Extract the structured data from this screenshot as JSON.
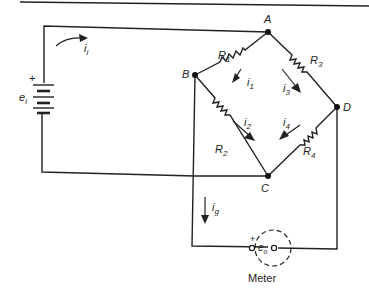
{
  "diagram": {
    "type": "wheatstone-bridge-circuit",
    "nodes": {
      "A": "A",
      "B": "B",
      "C": "C",
      "D": "D"
    },
    "resistors": {
      "r1": "R",
      "r1_sub": "1",
      "r2": "R",
      "r2_sub": "2",
      "r3": "R",
      "r3_sub": "3",
      "r4": "R",
      "r4_sub": "4"
    },
    "currents": {
      "ii": "i",
      "ii_sub": "i",
      "i1": "i",
      "i1_sub": "1",
      "i2": "i",
      "i2_sub": "2",
      "i3": "i",
      "i3_sub": "3",
      "i4": "i",
      "i4_sub": "4",
      "ig": "i",
      "ig_sub": "g"
    },
    "source": {
      "label": "e",
      "label_sub": "i",
      "polarity": "+"
    },
    "meter": {
      "label": "Meter",
      "reading": "e",
      "reading_sub": "o",
      "polarity": "+"
    },
    "colors": {
      "line": "#222222",
      "background": "#ffffff"
    }
  }
}
